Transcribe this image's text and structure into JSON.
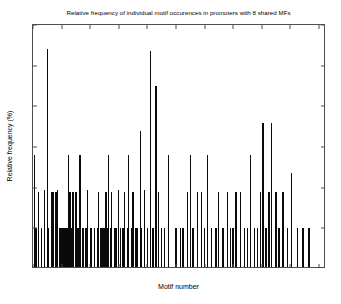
{
  "chart_data": {
    "type": "bar",
    "title": "Relative frequency of individual motif occurences in promoters with 8 shared MFs",
    "xlabel": "Motif number",
    "ylabel": "Relative frequency (%)",
    "xlim": [
      0,
      205
    ],
    "ylim": [
      0,
      6
    ],
    "xticks": [
      0,
      20,
      40,
      60,
      80,
      100,
      120,
      140,
      160,
      180,
      200
    ],
    "xticklabels": [
      "0",
      "20",
      "40",
      "60",
      "80",
      "100",
      "120",
      "140",
      "160",
      "180",
      "200"
    ],
    "yticks": [
      0,
      1,
      2,
      3,
      4,
      5,
      6
    ],
    "yticklabels": [
      "0",
      "1",
      "2",
      "3",
      "4",
      "5",
      "6"
    ],
    "grid": false,
    "legend": null,
    "bar_color": "#0a0a0a",
    "axis_color": "#4d4d4d",
    "x": [
      1,
      2,
      4,
      6,
      8,
      10,
      11,
      13,
      14,
      16,
      17,
      19,
      20,
      21,
      22,
      23,
      24,
      25,
      26,
      27,
      28,
      30,
      31,
      32,
      33,
      35,
      37,
      38,
      40,
      41,
      43,
      45,
      46,
      47,
      48,
      49,
      50,
      51,
      52,
      53,
      54,
      55,
      57,
      58,
      60,
      61,
      63,
      64,
      66,
      67,
      69,
      70,
      72,
      73,
      75,
      76,
      78,
      80,
      82,
      84,
      86,
      88,
      90,
      92,
      95,
      100,
      103,
      105,
      108,
      110,
      112,
      115,
      118,
      120,
      122,
      125,
      128,
      130,
      133,
      136,
      138,
      140,
      142,
      145,
      148,
      150,
      152,
      155,
      157,
      159,
      161,
      163,
      165,
      167,
      170,
      172,
      175,
      178,
      181,
      185,
      189,
      193
    ],
    "values": [
      2.75,
      0.95,
      1.85,
      0.95,
      1.9,
      5.35,
      0.95,
      1.85,
      1.85,
      1.85,
      1.9,
      0.95,
      0.95,
      0.95,
      0.95,
      0.95,
      0.95,
      2.75,
      1.85,
      0.95,
      1.85,
      1.85,
      0.95,
      0.95,
      2.75,
      0.95,
      0.95,
      1.9,
      0.95,
      0.95,
      0.95,
      0.95,
      1.85,
      0.95,
      0.95,
      0.95,
      0.95,
      1.85,
      0.95,
      2.75,
      0.95,
      1.85,
      0.95,
      0.95,
      1.9,
      0.95,
      0.95,
      1.85,
      0.95,
      2.75,
      0.95,
      1.85,
      0.95,
      0.95,
      3.35,
      0.95,
      1.9,
      0.95,
      5.3,
      0.95,
      4.45,
      1.85,
      0.95,
      0.95,
      2.75,
      0.95,
      0.95,
      0.95,
      1.85,
      2.75,
      0.95,
      1.85,
      1.85,
      0.95,
      2.75,
      0.95,
      0.95,
      1.85,
      0.95,
      1.85,
      0.95,
      0.95,
      1.85,
      1.85,
      0.95,
      0.95,
      2.75,
      0.95,
      0.95,
      1.85,
      3.55,
      0.95,
      1.85,
      3.55,
      1.85,
      0.95,
      1.85,
      0.95,
      2.3,
      0.95,
      0.95,
      0.95
    ]
  }
}
